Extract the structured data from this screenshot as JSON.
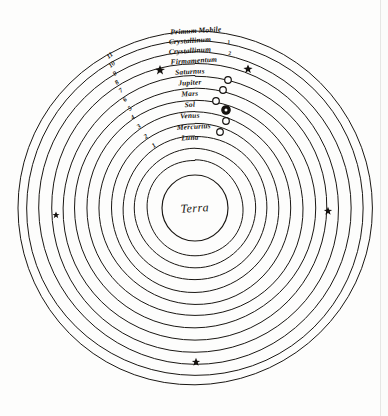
{
  "figure": {
    "title_center": "Terra",
    "type": "geocentric-cosmological-diagram",
    "ink_color": "#16130f",
    "paper_color": "#fdfdfc"
  },
  "center": {
    "cx": 195,
    "cy": 208,
    "label": "Terra",
    "radius": 33
  },
  "spheres": [
    {
      "index": 1,
      "number": "1",
      "label": "Luna",
      "radius": 48,
      "label_x": 196,
      "label_y": 139,
      "marker": "open-circle",
      "marker_x": 220,
      "marker_y": 132,
      "num_x": 155,
      "num_y": 147
    },
    {
      "index": 2,
      "number": "2",
      "label": "Mercurius",
      "radius": 60,
      "label_x": 196,
      "label_y": 127,
      "marker": "open-circle",
      "marker_x": 226,
      "marker_y": 121,
      "num_x": 147,
      "num_y": 138
    },
    {
      "index": 3,
      "number": "3",
      "label": "Venus",
      "radius": 72,
      "label_x": 196,
      "label_y": 116,
      "marker": "ringed-circle",
      "marker_x": 226,
      "marker_y": 110,
      "num_x": 140,
      "num_y": 128
    },
    {
      "index": 4,
      "number": "4",
      "label": "Sol",
      "radius": 84,
      "label_x": 196,
      "label_y": 105,
      "marker": "open-circle",
      "marker_x": 216,
      "marker_y": 101,
      "num_x": 134,
      "num_y": 119
    },
    {
      "index": 5,
      "number": "5",
      "label": "Mars",
      "radius": 96,
      "label_x": 196,
      "label_y": 94,
      "marker": "open-circle",
      "marker_x": 223,
      "marker_y": 90,
      "num_x": 131,
      "num_y": 110
    },
    {
      "index": 6,
      "number": "6",
      "label": "Jupiter",
      "radius": 108,
      "label_x": 196,
      "label_y": 83,
      "marker": "open-circle",
      "marker_x": 228,
      "marker_y": 80,
      "num_x": 126,
      "num_y": 101
    },
    {
      "index": 7,
      "number": "7",
      "label": "Saturnus",
      "radius": 120,
      "label_x": 196,
      "label_y": 72,
      "marker": "star",
      "marker_x": 248,
      "marker_y": 69,
      "num_x": 122,
      "num_y": 92
    },
    {
      "index": 8,
      "number": "8",
      "label": "Firmamentum",
      "radius": 132,
      "label_x": 196,
      "label_y": 61,
      "marker": "none",
      "marker_x": 0,
      "marker_y": 0,
      "num_x": 118,
      "num_y": 84
    },
    {
      "index": 9,
      "number": "9",
      "label": "Crystallinum",
      "sublabel": "2",
      "radius": 144,
      "label_x": 196,
      "label_y": 51,
      "marker": "none",
      "marker_x": 0,
      "marker_y": 0,
      "num_x": 116,
      "num_y": 75
    },
    {
      "index": 10,
      "number": "10",
      "label": "Crystallinum",
      "sublabel": "1",
      "radius": 156,
      "label_x": 196,
      "label_y": 42,
      "marker": "none",
      "marker_x": 0,
      "marker_y": 0,
      "num_x": 113,
      "num_y": 66
    },
    {
      "index": 11,
      "number": "11",
      "label": "Primum Mobile",
      "radius": 168,
      "label_x": 196,
      "label_y": 33,
      "marker": "none",
      "marker_x": 0,
      "marker_y": 0,
      "num_x": 111,
      "num_y": 57
    },
    {
      "index": 12,
      "number": "",
      "label": "",
      "radius": 177,
      "label_x": 0,
      "label_y": 0,
      "marker": "none",
      "marker_x": 0,
      "marker_y": 0,
      "num_x": 0,
      "num_y": 0
    }
  ],
  "stars": [
    {
      "name": "star-saturnus-left",
      "x": 160,
      "y": 70,
      "size": 5.0
    },
    {
      "name": "star-saturnus-right",
      "x": 248,
      "y": 69,
      "size": 4.6
    },
    {
      "name": "star-west",
      "x": 56,
      "y": 215,
      "size": 3.6
    },
    {
      "name": "star-east",
      "x": 328,
      "y": 211,
      "size": 4.2
    },
    {
      "name": "star-south",
      "x": 196,
      "y": 362,
      "size": 4.2
    }
  ],
  "labels": {
    "primum_mobile": "Primum Mobile",
    "crystallinum_1": "Crystallinum",
    "crystallinum_1_num": "1",
    "crystallinum_2": "Crystallinum",
    "crystallinum_2_num": "2",
    "firmamentum": "Firmamentum",
    "saturnus": "Saturnus",
    "jupiter": "Jupiter",
    "mars": "Mars",
    "sol": "Sol",
    "venus": "Venus",
    "mercurius": "Mercurius",
    "luna": "Luna",
    "terra": "Terra"
  },
  "numbers": [
    "11",
    "10",
    "9",
    "8",
    "7",
    "6",
    "5",
    "4",
    "3",
    "2",
    "1"
  ]
}
